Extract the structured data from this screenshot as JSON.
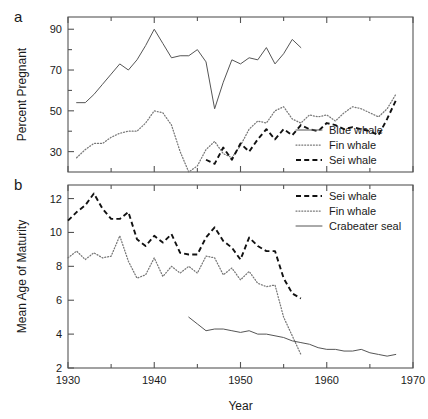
{
  "figure": {
    "panel_a_label": "a",
    "panel_b_label": "b",
    "xlabel": "Year"
  },
  "chart_data": [
    {
      "type": "line",
      "panel": "a",
      "title": "",
      "xlabel": "",
      "ylabel": "Percent Pregnant",
      "xlim": [
        1930,
        1970
      ],
      "ylim": [
        20,
        96
      ],
      "xticks": [
        1930,
        1940,
        1950,
        1960,
        1970
      ],
      "xtick_labels": [
        "1930",
        "1940",
        "1950",
        "1960",
        "1970"
      ],
      "xminor_ticks": [
        1935,
        1945,
        1955,
        1965
      ],
      "yticks": [
        30,
        50,
        70,
        90
      ],
      "ytick_labels": [
        "30",
        "50",
        "70",
        "90"
      ],
      "yminor_ticks": [
        40,
        60,
        80
      ],
      "grid": false,
      "legend_position": "bottom-right",
      "series": [
        {
          "name": "Blue whale",
          "style": "solid",
          "color": "#555555",
          "x": [
            1931,
            1932,
            1933,
            1934,
            1935,
            1936,
            1937,
            1938,
            1939,
            1940,
            1941,
            1942,
            1943,
            1944,
            1945,
            1946,
            1947,
            1948,
            1949,
            1950,
            1951,
            1952,
            1953,
            1954,
            1955,
            1956,
            1957
          ],
          "values": [
            54,
            54,
            58,
            63,
            68,
            73,
            70,
            75,
            82,
            90,
            83,
            76,
            77,
            77,
            80,
            74,
            51,
            64,
            75,
            73,
            76,
            75,
            81,
            73,
            78,
            85,
            81
          ]
        },
        {
          "name": "Fin whale",
          "style": "dotted",
          "color": "#777777",
          "x": [
            1931,
            1932,
            1933,
            1934,
            1935,
            1936,
            1937,
            1938,
            1939,
            1940,
            1941,
            1942,
            1943,
            1944,
            1945,
            1946,
            1947,
            1948,
            1949,
            1950,
            1951,
            1952,
            1953,
            1954,
            1955,
            1956,
            1957,
            1958,
            1959,
            1960,
            1961,
            1962,
            1963,
            1964,
            1965,
            1966,
            1967,
            1968
          ],
          "values": [
            27,
            31,
            34,
            34,
            37,
            39,
            40,
            40,
            44,
            50,
            49,
            43,
            30,
            20,
            23,
            31,
            35,
            29,
            27,
            33,
            41,
            45,
            44,
            50,
            52,
            46,
            44,
            48,
            47,
            48,
            45,
            49,
            52,
            51,
            49,
            47,
            51,
            58
          ]
        },
        {
          "name": "Sei whale",
          "style": "dashed",
          "color": "#111111",
          "x": [
            1946,
            1947,
            1948,
            1949,
            1950,
            1951,
            1952,
            1953,
            1954,
            1955,
            1956,
            1957,
            1958,
            1959,
            1960,
            1961,
            1962,
            1963,
            1964,
            1965,
            1966,
            1967,
            1968
          ],
          "values": [
            26,
            24,
            32,
            26,
            34,
            30,
            36,
            41,
            36,
            41,
            38,
            43,
            41,
            40,
            44,
            43,
            41,
            42,
            41,
            40,
            38,
            46,
            55
          ]
        }
      ],
      "legend": [
        {
          "label": "Blue whale",
          "style": "solid"
        },
        {
          "label": "Fin whale",
          "style": "dotted"
        },
        {
          "label": "Sei whale",
          "style": "dashed"
        }
      ]
    },
    {
      "type": "line",
      "panel": "b",
      "title": "",
      "xlabel": "Year",
      "ylabel": "Mean Age of Maturity",
      "xlim": [
        1930,
        1970
      ],
      "ylim": [
        2,
        12.8
      ],
      "xticks": [
        1930,
        1940,
        1950,
        1960,
        1970
      ],
      "xtick_labels": [
        "1930",
        "1940",
        "1950",
        "1960",
        "1970"
      ],
      "xminor_ticks": [
        1935,
        1945,
        1955,
        1965
      ],
      "yticks": [
        2,
        4,
        6,
        8,
        10,
        12
      ],
      "ytick_labels": [
        "2",
        "4",
        "6",
        "8",
        "10",
        "12"
      ],
      "grid": false,
      "legend_position": "top-right",
      "series": [
        {
          "name": "Sei whale",
          "style": "dashed",
          "color": "#111111",
          "x": [
            1930,
            1931,
            1932,
            1933,
            1934,
            1935,
            1936,
            1937,
            1938,
            1939,
            1940,
            1941,
            1942,
            1943,
            1944,
            1945,
            1946,
            1947,
            1948,
            1949,
            1950,
            1951,
            1952,
            1953,
            1954,
            1955,
            1956,
            1957
          ],
          "values": [
            10.7,
            11.2,
            11.6,
            12.3,
            11.4,
            10.8,
            10.8,
            11.2,
            9.6,
            9.2,
            9.8,
            9.4,
            9.9,
            8.8,
            8.7,
            8.7,
            9.7,
            10.3,
            9.5,
            9.1,
            8.4,
            9.7,
            9.2,
            8.9,
            8.9,
            7.3,
            6.4,
            6.1
          ]
        },
        {
          "name": "Fin whale",
          "style": "dotted",
          "color": "#777777",
          "x": [
            1930,
            1931,
            1932,
            1933,
            1934,
            1935,
            1936,
            1937,
            1938,
            1939,
            1940,
            1941,
            1942,
            1943,
            1944,
            1945,
            1946,
            1947,
            1948,
            1949,
            1950,
            1951,
            1952,
            1953,
            1954,
            1955,
            1956,
            1957
          ],
          "values": [
            8.5,
            8.9,
            8.4,
            8.8,
            8.5,
            8.6,
            9.8,
            8.3,
            7.3,
            7.5,
            8.5,
            7.4,
            8.0,
            7.6,
            8.0,
            7.6,
            8.6,
            8.5,
            7.5,
            7.9,
            7.2,
            7.7,
            7.0,
            6.8,
            6.9,
            5.0,
            3.9,
            2.8
          ]
        },
        {
          "name": "Crabeater seal",
          "style": "solid",
          "color": "#555555",
          "x": [
            1944,
            1945,
            1946,
            1947,
            1948,
            1949,
            1950,
            1951,
            1952,
            1953,
            1954,
            1955,
            1956,
            1957,
            1958,
            1959,
            1960,
            1961,
            1962,
            1963,
            1964,
            1965,
            1966,
            1967,
            1968
          ],
          "values": [
            5.0,
            4.6,
            4.2,
            4.3,
            4.3,
            4.2,
            4.1,
            4.2,
            4.0,
            4.0,
            3.9,
            3.8,
            3.6,
            3.5,
            3.4,
            3.2,
            3.1,
            3.1,
            3.0,
            3.0,
            3.1,
            2.9,
            2.8,
            2.7,
            2.8
          ]
        }
      ],
      "legend": [
        {
          "label": "Sei whale",
          "style": "dashed"
        },
        {
          "label": "Fin whale",
          "style": "dotted"
        },
        {
          "label": "Crabeater seal",
          "style": "solid"
        }
      ]
    }
  ]
}
